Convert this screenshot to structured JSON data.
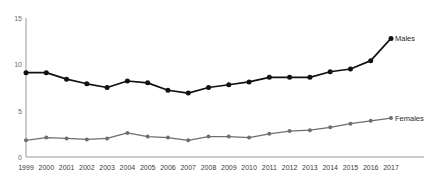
{
  "chart_data": {
    "type": "line",
    "title": "",
    "subtitle": "",
    "xlabel": "",
    "ylabel": "",
    "grid": false,
    "legend_position": "line-end",
    "x": [
      1999,
      2000,
      2001,
      2002,
      2003,
      2004,
      2005,
      2006,
      2007,
      2008,
      2009,
      2010,
      2011,
      2012,
      2013,
      2014,
      2015,
      2016,
      2017
    ],
    "categories": [
      "1999",
      "2000",
      "2001",
      "2002",
      "2003",
      "2004",
      "2005",
      "2006",
      "2007",
      "2008",
      "2009",
      "2010",
      "2011",
      "2012",
      "2013",
      "2014",
      "2015",
      "2016",
      "2017"
    ],
    "xlim": [
      1999,
      2017
    ],
    "ylim": [
      0,
      15
    ],
    "yticks": [
      0,
      5,
      10,
      15
    ],
    "ytick_labels": [
      "0",
      "5",
      "10",
      "15"
    ],
    "series": [
      {
        "name": "Males",
        "color": "#111111",
        "values": [
          9.1,
          9.1,
          8.4,
          7.9,
          7.5,
          8.2,
          8.0,
          7.2,
          6.9,
          7.5,
          7.8,
          8.1,
          8.6,
          8.6,
          8.6,
          9.2,
          9.5,
          10.4,
          12.8
        ]
      },
      {
        "name": "Females",
        "color": "#6e6e6e",
        "values": [
          1.8,
          2.1,
          2.0,
          1.9,
          2.0,
          2.6,
          2.2,
          2.1,
          1.8,
          2.2,
          2.2,
          2.1,
          2.5,
          2.8,
          2.9,
          3.2,
          3.6,
          3.9,
          4.2
        ]
      }
    ]
  },
  "axis": {
    "y_label_0": "0",
    "y_label_5": "5",
    "y_label_10": "10",
    "y_label_15": "15"
  },
  "labels": {
    "males": "Males",
    "females": "Females"
  }
}
